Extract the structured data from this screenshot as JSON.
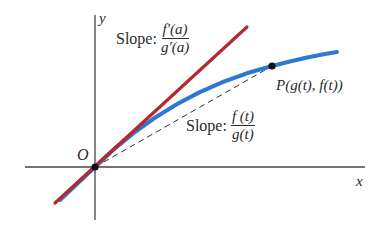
{
  "diagram": {
    "axes": {
      "x_label": "x",
      "y_label": "y",
      "origin_label": "O"
    },
    "point": {
      "label": "P(g(t), f(t))"
    },
    "tangent_annotation": {
      "prefix": "Slope:",
      "numerator": "f′(a)",
      "denominator": "g′(a)"
    },
    "secant_annotation": {
      "prefix": "Slope:",
      "numerator": "f (t)",
      "denominator": "g(t)"
    },
    "colors": {
      "tangent_line": "#b5292d",
      "curve": "#2f78d0",
      "axes": "#444444",
      "secant_dashed": "#333333",
      "point": "#111111"
    }
  }
}
